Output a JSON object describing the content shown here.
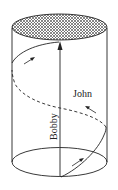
{
  "diagram": {
    "shape": "cylinder",
    "top_face": "cross-hatched ellipse",
    "paths": [
      {
        "name": "Bobby",
        "label": "Bobby",
        "description": "straight vertical path from bottom center to top center",
        "arrow": "up"
      },
      {
        "name": "John",
        "label": "John",
        "description": "helical path winding once around the cylinder surface, solid on front, dashed on back",
        "arrows": 3
      }
    ]
  },
  "labels": {
    "bobby": "Bobby",
    "john": "John"
  },
  "colors": {
    "line": "#222222",
    "background": "#ffffff",
    "hatch": "#555555"
  }
}
